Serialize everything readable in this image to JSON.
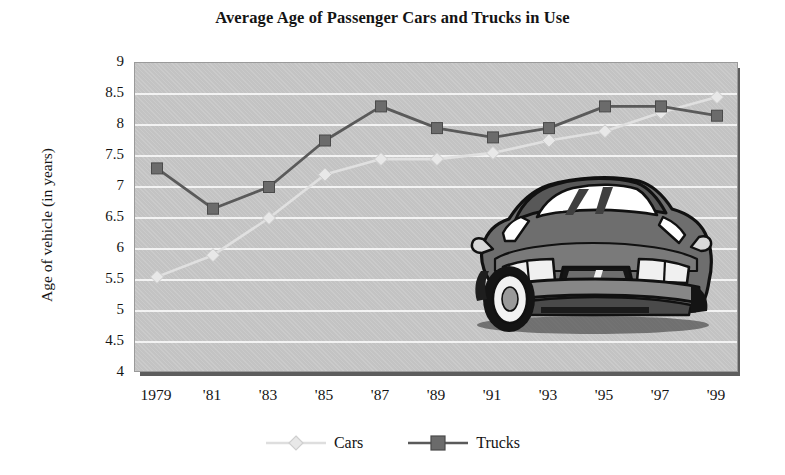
{
  "chart_data": {
    "type": "line",
    "title": "Average Age of Passenger Cars and Trucks in Use",
    "xlabel": "",
    "ylabel": "Age of vehicle (in years)",
    "ylim": [
      4,
      9
    ],
    "ytick_step": 0.5,
    "yticks": [
      "9",
      "8.5",
      "8",
      "7.5",
      "7",
      "6.5",
      "6",
      "5.5",
      "5",
      "4.5",
      "4"
    ],
    "grid": true,
    "legend_position": "bottom",
    "x": [
      1979,
      1981,
      1983,
      1985,
      1987,
      1989,
      1991,
      1993,
      1995,
      1997,
      1999
    ],
    "categories": [
      "1979",
      "'81",
      "'83",
      "'85",
      "'87",
      "'89",
      "'91",
      "'93",
      "'95",
      "'97",
      "'99"
    ],
    "series": [
      {
        "name": "Cars",
        "marker": "diamond",
        "color": "#e8e8e8",
        "line_color": "#e0e0e0",
        "values": [
          5.55,
          5.9,
          6.5,
          7.2,
          7.45,
          7.45,
          7.55,
          7.75,
          7.9,
          8.2,
          8.45
        ]
      },
      {
        "name": "Trucks",
        "marker": "square",
        "color": "#6b6b6b",
        "line_color": "#5a5a5a",
        "values": [
          7.3,
          6.65,
          7.0,
          7.75,
          8.3,
          7.95,
          7.8,
          7.95,
          8.3,
          8.3,
          8.15
        ]
      }
    ],
    "annotations": [
      {
        "name": "car-illustration",
        "description": "gray front three-quarter view sedan drawing overlaid on the lower right of the plot area"
      }
    ]
  },
  "chart": {
    "title": "Average Age of Passenger Cars and Trucks in Use",
    "y_axis_title": "Age of vehicle (in years)"
  },
  "legend": {
    "items": [
      {
        "label": "Cars",
        "marker": "diamond-marker",
        "swatch": "#e8e8e8"
      },
      {
        "label": "Trucks",
        "marker": "square-marker",
        "swatch": "#6b6b6b"
      }
    ]
  },
  "colors": {
    "plot_background": "#c3c3c3",
    "gridline": "#f2f2f2",
    "plot_shadow": "#5d5d5d",
    "cars_series": "#e0e0e0",
    "trucks_series": "#5a5a5a",
    "text": "#141414",
    "page_background": "#ffffff"
  }
}
